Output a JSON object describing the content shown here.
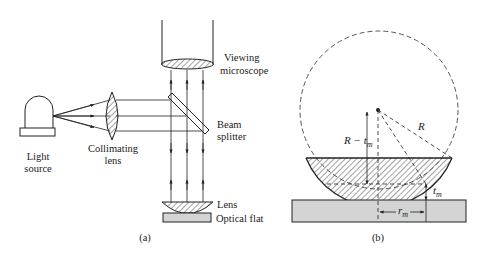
{
  "figure_a": {
    "caption": "(a)",
    "labels": {
      "light_source_1": "Light",
      "light_source_2": "source",
      "collimating_1": "Collimating",
      "collimating_2": "lens",
      "viewing_1": "Viewing",
      "viewing_2": "microscope",
      "beam_1": "Beam",
      "beam_2": "splitter",
      "lens": "Lens",
      "optical_flat": "Optical flat"
    }
  },
  "figure_b": {
    "caption": "(b)",
    "labels": {
      "radius": "R",
      "r_minus_t": "R − t",
      "r_minus_t_sub": "m",
      "t": "t",
      "t_sub": "m",
      "r": "r",
      "r_sub": "m"
    }
  },
  "colors": {
    "line": "#222222",
    "flat_fill": "#d4d4d4",
    "background": "#ffffff"
  }
}
